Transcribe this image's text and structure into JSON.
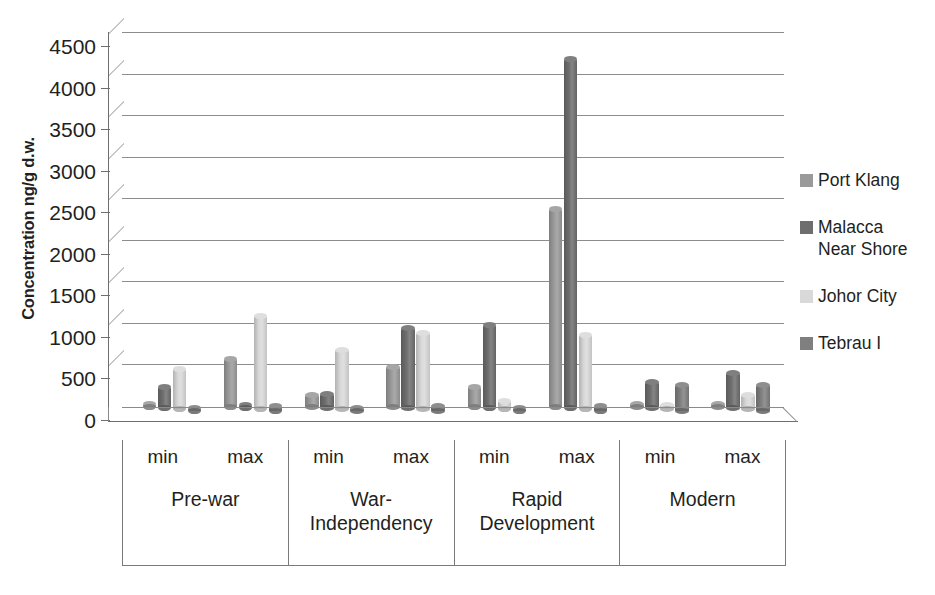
{
  "chart_data": {
    "type": "bar",
    "title": "",
    "subtitle": "",
    "xlabel": "",
    "ylabel": "Concentration ng/g d.w.",
    "ylim": [
      0,
      4500
    ],
    "ytick_step": 500,
    "yticks": [
      "0",
      "500",
      "1000",
      "1500",
      "2000",
      "2500",
      "3000",
      "3500",
      "4000",
      "4500"
    ],
    "grid": true,
    "legend_position": "right",
    "style_note": "3-D clustered cylinder bars",
    "group_labels": [
      "Pre-war",
      "War-Independency",
      "Rapid Development",
      "Modern"
    ],
    "sub_labels": [
      "min",
      "max"
    ],
    "categories": [
      "Pre-war min",
      "Pre-war max",
      "War-Independency min",
      "War-Independency max",
      "Rapid Development min",
      "Rapid Development max",
      "Modern min",
      "Modern max"
    ],
    "series": [
      {
        "name": "Port Klang",
        "color": "#9a9a9a",
        "values": [
          10,
          580,
          150,
          480,
          240,
          2380,
          30,
          40
        ]
      },
      {
        "name": "Malacca Near Shore",
        "color": "#6e6e6e",
        "values": [
          250,
          20,
          170,
          960,
          1000,
          4200,
          310,
          420
        ]
      },
      {
        "name": "Johor City",
        "color": "#d9d9d9",
        "values": [
          490,
          1130,
          720,
          920,
          100,
          900,
          50,
          170
        ]
      },
      {
        "name": "Tebrau I",
        "color": "#7f7f7f",
        "values": [
          10,
          50,
          15,
          60,
          20,
          50,
          310,
          310
        ]
      }
    ]
  },
  "legend": {
    "items": [
      {
        "label": "Port Klang"
      },
      {
        "label": "Malacca\nNear Shore"
      },
      {
        "label": "Johor City"
      },
      {
        "label": "Tebrau I"
      }
    ]
  },
  "axis": {
    "y_title": "Concentration ng/g d.w."
  }
}
